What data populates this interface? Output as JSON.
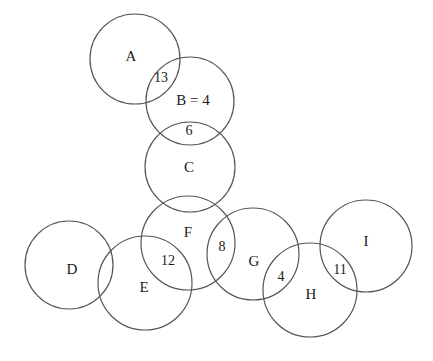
{
  "diagram": {
    "type": "circle-packing-graph",
    "width": 433,
    "height": 361,
    "background_color": "#ffffff",
    "stroke_color": "#555555",
    "stroke_width": 1.2,
    "text_color": "#1a1a1a",
    "nodes": [
      {
        "id": "A",
        "label": "A",
        "cx": 135,
        "cy": 59,
        "r": 45,
        "label_x": 131,
        "label_y": 56
      },
      {
        "id": "B",
        "label": "B = 4",
        "cx": 190,
        "cy": 101,
        "r": 44,
        "label_x": 193,
        "label_y": 100
      },
      {
        "id": "C",
        "label": "C",
        "cx": 190,
        "cy": 167,
        "r": 45,
        "label_x": 189,
        "label_y": 167
      },
      {
        "id": "D",
        "label": "D",
        "cx": 69,
        "cy": 265,
        "r": 44,
        "label_x": 72,
        "label_y": 269
      },
      {
        "id": "E",
        "label": "E",
        "cx": 145,
        "cy": 283,
        "r": 47,
        "label_x": 144,
        "label_y": 287
      },
      {
        "id": "F",
        "label": "F",
        "cx": 188,
        "cy": 243,
        "r": 47,
        "label_x": 188,
        "label_y": 232
      },
      {
        "id": "G",
        "label": "G",
        "cx": 253,
        "cy": 254,
        "r": 46,
        "label_x": 254,
        "label_y": 261
      },
      {
        "id": "H",
        "label": "H",
        "cx": 310,
        "cy": 290,
        "r": 47,
        "label_x": 311,
        "label_y": 294
      },
      {
        "id": "I",
        "label": "I",
        "cx": 366,
        "cy": 246,
        "r": 46,
        "label_x": 366,
        "label_y": 241
      }
    ],
    "edge_weights": [
      {
        "id": "A-B",
        "value": "13",
        "x": 161,
        "y": 78
      },
      {
        "id": "B-C",
        "value": "6",
        "x": 189,
        "y": 131
      },
      {
        "id": "C-F",
        "value": "",
        "x": 0,
        "y": 0
      },
      {
        "id": "F-G",
        "value": "8",
        "x": 222,
        "y": 247
      },
      {
        "id": "E-F",
        "value": "12",
        "x": 168,
        "y": 261
      },
      {
        "id": "G-H",
        "value": "4",
        "x": 281,
        "y": 277
      },
      {
        "id": "H-I",
        "value": "11",
        "x": 340,
        "y": 270
      }
    ]
  }
}
